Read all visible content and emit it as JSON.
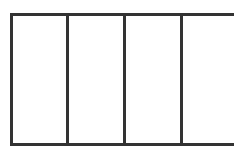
{
  "diagram": {
    "type": "rectangle divided into vertical panels",
    "panel_count": 4,
    "line_color": "#333333",
    "background_color": "#ffffff",
    "panels": [
      {
        "label": ""
      },
      {
        "label": ""
      },
      {
        "label": ""
      },
      {
        "label": ""
      }
    ]
  }
}
